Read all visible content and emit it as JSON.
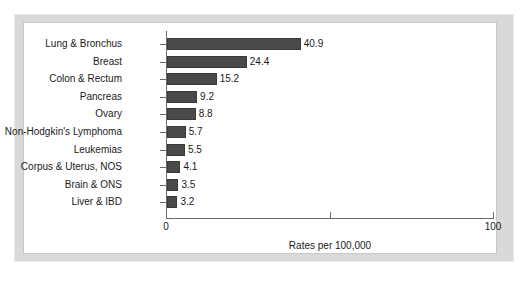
{
  "chart_data": {
    "type": "bar",
    "orientation": "horizontal",
    "title": "",
    "xlabel": "Rates per 100,000",
    "ylabel": "",
    "xlim": [
      0,
      100
    ],
    "xticks": [
      {
        "value": 0,
        "label": "0"
      },
      {
        "value": 50,
        "label": ""
      },
      {
        "value": 100,
        "label": "100"
      }
    ],
    "grid": false,
    "legend": null,
    "bar_color": "#4a4a4a",
    "categories": [
      "Lung & Bronchus",
      "Breast",
      "Colon & Rectum",
      "Pancreas",
      "Ovary",
      "Non-Hodgkin's Lymphoma",
      "Leukemias",
      "Corpus & Uterus, NOS",
      "Brain & ONS",
      "Liver & IBD"
    ],
    "values": [
      40.9,
      24.4,
      15.2,
      9.2,
      8.8,
      5.7,
      5.5,
      4.1,
      3.5,
      3.2
    ],
    "value_labels": [
      "40.9",
      "24.4",
      "15.2",
      "9.2",
      "8.8",
      "5.7",
      "5.5",
      "4.1",
      "3.5",
      "3.2"
    ]
  },
  "frame": {
    "border_color": "#d9d9d9",
    "background": "#ffffff"
  }
}
